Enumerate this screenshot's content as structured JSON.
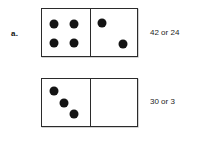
{
  "problem": {
    "label": "a."
  },
  "dominoes": [
    {
      "name": "domino-top",
      "left_half": {
        "pip_count": 4,
        "pips": [
          {
            "x": 26,
            "y": 31
          },
          {
            "x": 68,
            "y": 31
          },
          {
            "x": 26,
            "y": 72
          },
          {
            "x": 68,
            "y": 72
          }
        ]
      },
      "right_half": {
        "pip_count": 2,
        "pips": [
          {
            "x": 24,
            "y": 30
          },
          {
            "x": 70,
            "y": 74
          }
        ]
      },
      "answer": "42 or 24"
    },
    {
      "name": "domino-bottom",
      "left_half": {
        "pip_count": 3,
        "pips": [
          {
            "x": 26,
            "y": 26
          },
          {
            "x": 47,
            "y": 50
          },
          {
            "x": 68,
            "y": 74
          }
        ]
      },
      "right_half": {
        "pip_count": 0,
        "pips": []
      },
      "answer": "30 or 3"
    }
  ],
  "colors": {
    "pip": "#141414",
    "border": "#2b2b2b",
    "text": "#1d1d1d",
    "background": "#ffffff"
  }
}
